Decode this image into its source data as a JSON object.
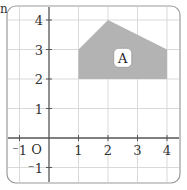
{
  "corner_text": "n",
  "grid": {
    "x_min": -1.5,
    "x_max": 4.4,
    "y_min": -1.5,
    "y_max": 4.4,
    "origin_px": [
      49,
      138
    ],
    "unit_px": 29.5,
    "gridline_color": "#d9d9d9",
    "axis_color": "#555555",
    "frame_color": "#9a9a9a"
  },
  "axes": {
    "origin_label": "O",
    "x_tick_labels": [
      {
        "value": -1,
        "label": "-1"
      },
      {
        "value": 1,
        "label": "1"
      },
      {
        "value": 2,
        "label": "2"
      },
      {
        "value": 3,
        "label": "3"
      },
      {
        "value": 4,
        "label": "4"
      }
    ],
    "y_tick_labels": [
      {
        "value": 4,
        "label": "4"
      },
      {
        "value": 3,
        "label": "3"
      },
      {
        "value": 2,
        "label": "2"
      },
      {
        "value": 1,
        "label": "1"
      },
      {
        "value": -1,
        "label": "-1"
      }
    ]
  },
  "shapes": [
    {
      "name": "A",
      "label": "A",
      "fill": "#b3b3b3",
      "vertices": [
        [
          1,
          2
        ],
        [
          1,
          3
        ],
        [
          2,
          4
        ],
        [
          4,
          3
        ],
        [
          4,
          2
        ]
      ],
      "label_position": [
        2.5,
        2.7
      ]
    }
  ]
}
